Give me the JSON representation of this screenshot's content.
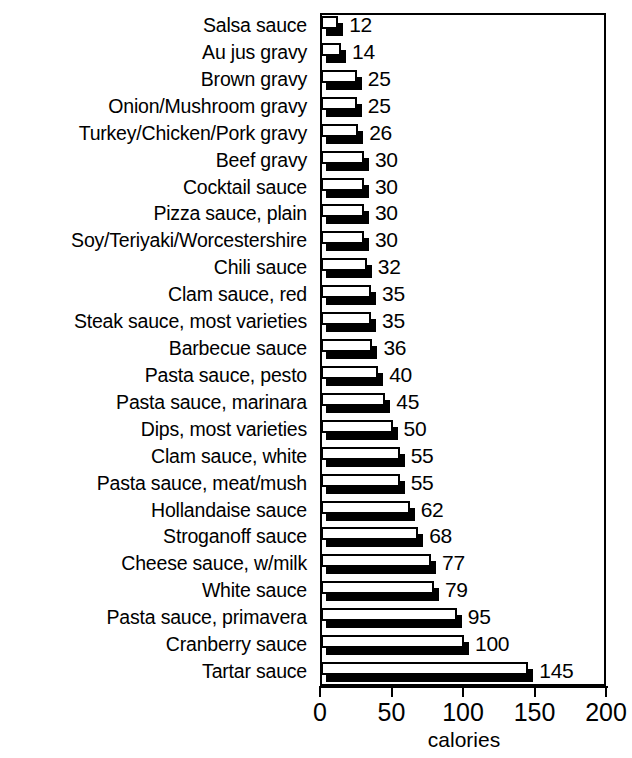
{
  "chart_data": {
    "type": "bar",
    "orientation": "horizontal",
    "title": "",
    "xlabel": "calories",
    "ylabel": "",
    "xlim": [
      0,
      200
    ],
    "xticks": [
      0,
      50,
      100,
      150,
      200
    ],
    "grid": false,
    "legend": null,
    "value_labels": true,
    "categories": [
      "Salsa sauce",
      "Au jus gravy",
      "Brown gravy",
      "Onion/Mushroom gravy",
      "Turkey/Chicken/Pork gravy",
      "Beef gravy",
      "Cocktail sauce",
      "Pizza sauce, plain",
      "Soy/Teriyaki/Worcestershire",
      "Chili sauce",
      "Clam sauce, red",
      "Steak sauce, most varieties",
      "Barbecue sauce",
      "Pasta sauce, pesto",
      "Pasta sauce, marinara",
      "Dips, most varieties",
      "Clam sauce, white",
      "Pasta sauce, meat/mush",
      "Hollandaise sauce",
      "Stroganoff sauce",
      "Cheese sauce, w/milk",
      "White sauce",
      "Pasta sauce, primavera",
      "Cranberry sauce",
      "Tartar sauce"
    ],
    "values": [
      12,
      14,
      25,
      25,
      26,
      30,
      30,
      30,
      30,
      32,
      35,
      35,
      36,
      40,
      45,
      50,
      55,
      55,
      62,
      68,
      77,
      79,
      95,
      100,
      145
    ],
    "colors": {
      "bar_face": "#ffffff",
      "bar_outline": "#000000",
      "bar_shadow": "#000000",
      "axis": "#000000",
      "text": "#000000",
      "background": "#ffffff"
    }
  },
  "axis": {
    "tick_labels": [
      "0",
      "50",
      "100",
      "150",
      "200"
    ],
    "title": "calories"
  }
}
